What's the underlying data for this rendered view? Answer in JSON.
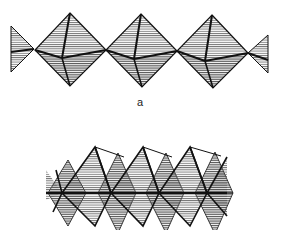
{
  "figure": {
    "panels": [
      {
        "id": "a",
        "label": "a",
        "label_pos": [
          137,
          96
        ],
        "style": "corner-sharing octahedra chain",
        "octahedra": [
          {
            "top": [
              70,
              13
            ],
            "left": [
              35,
              50
            ],
            "right": [
              106,
              50
            ],
            "bottom": [
              70,
              86
            ],
            "center": [
              62,
              58
            ]
          },
          {
            "top": [
              141,
              14
            ],
            "left": [
              106,
              50
            ],
            "right": [
              177,
              51
            ],
            "bottom": [
              142,
              87
            ],
            "center": [
              134,
              59
            ]
          },
          {
            "top": [
              212,
              15
            ],
            "left": [
              177,
              51
            ],
            "right": [
              248,
              53
            ],
            "bottom": [
              213,
              88
            ],
            "center": [
              205,
              61
            ]
          }
        ],
        "partials": [
          {
            "side": "left",
            "points": [
              [
                11,
                26
              ],
              [
                34,
                49
              ],
              [
                11,
                72
              ]
            ],
            "mid": [
              11,
              52
            ]
          },
          {
            "side": "right",
            "points": [
              [
                268,
                35
              ],
              [
                248,
                53
              ],
              [
                268,
                73
              ]
            ],
            "mid": [
              268,
              60
            ]
          }
        ]
      },
      {
        "id": "b",
        "label": "",
        "style": "edge-sharing octahedra chain",
        "axis_y": 193,
        "axis_x": [
          46,
          227
        ],
        "top_apexes": [
          [
            95,
            147
          ],
          [
            143,
            147
          ],
          [
            190,
            147
          ]
        ],
        "bottom_apexes": [
          [
            95,
            226
          ],
          [
            143,
            226
          ],
          [
            190,
            226
          ]
        ],
        "mid_vertices": [
          [
            62,
            193
          ],
          [
            111,
            193
          ],
          [
            159,
            193
          ],
          [
            207,
            193
          ]
        ],
        "back_peaks": [
          [
            68,
            160
          ],
          [
            118,
            153
          ],
          [
            166,
            153
          ],
          [
            215,
            152
          ]
        ]
      }
    ],
    "colors": {
      "line": "#111111",
      "hatch": "#555555",
      "background": "#ffffff"
    }
  }
}
